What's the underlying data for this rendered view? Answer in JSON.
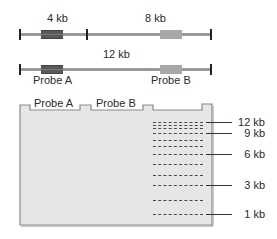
{
  "map": {
    "top_row": {
      "segments": [
        {
          "label": "4 kb"
        },
        {
          "label": "8 kb"
        }
      ]
    },
    "bottom_row": {
      "segment_label": "12 kb",
      "probe_labels": [
        "Probe A",
        "Probe B"
      ]
    }
  },
  "gel": {
    "lanes": [
      {
        "label": "Probe A"
      },
      {
        "label": "Probe B"
      }
    ],
    "ladder_sizes": [
      {
        "label": "12 kb"
      },
      {
        "label": "9 kb"
      },
      {
        "label": "6 kb"
      },
      {
        "label": "3 kb"
      },
      {
        "label": "1 kb"
      }
    ]
  },
  "colors": {
    "gel_fill": "#e6e6e6",
    "gel_border": "#8a8a8a",
    "dna_line": "#9a9a9a",
    "probe_a": "#5a5a5a",
    "probe_b": "#a8a8a8"
  }
}
